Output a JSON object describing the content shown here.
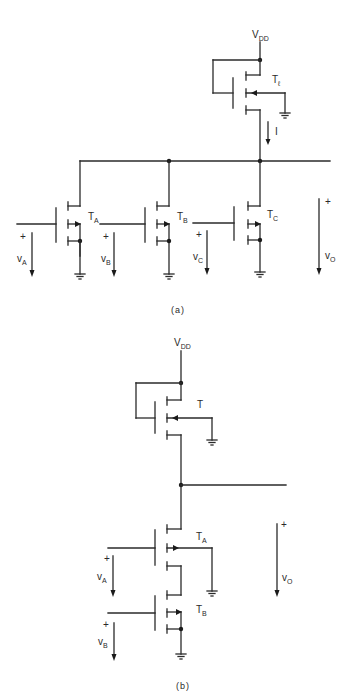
{
  "figure_a": {
    "caption": "(a)",
    "supply": {
      "main": "V",
      "sub": "DD"
    },
    "load_transistor": {
      "main": "T",
      "sub": "ℓ"
    },
    "current_label": "I",
    "transistors": [
      {
        "main": "T",
        "sub": "A"
      },
      {
        "main": "T",
        "sub": "B"
      },
      {
        "main": "T",
        "sub": "C"
      }
    ],
    "inputs": [
      {
        "main": "v",
        "sub": "A",
        "polarity": "+"
      },
      {
        "main": "v",
        "sub": "B",
        "polarity": "+"
      },
      {
        "main": "v",
        "sub": "C",
        "polarity": "+"
      }
    ],
    "output": {
      "main": "v",
      "sub": "O",
      "polarity": "+"
    }
  },
  "figure_b": {
    "caption": "(b)",
    "supply": {
      "main": "V",
      "sub": "DD"
    },
    "load_transistor": {
      "main": "T",
      "sub": ""
    },
    "transistors": [
      {
        "main": "T",
        "sub": "A"
      },
      {
        "main": "T",
        "sub": "B"
      }
    ],
    "inputs": [
      {
        "main": "v",
        "sub": "A",
        "polarity": "+"
      },
      {
        "main": "v",
        "sub": "B",
        "polarity": "+"
      }
    ],
    "output": {
      "main": "v",
      "sub": "O",
      "polarity": "+"
    }
  }
}
